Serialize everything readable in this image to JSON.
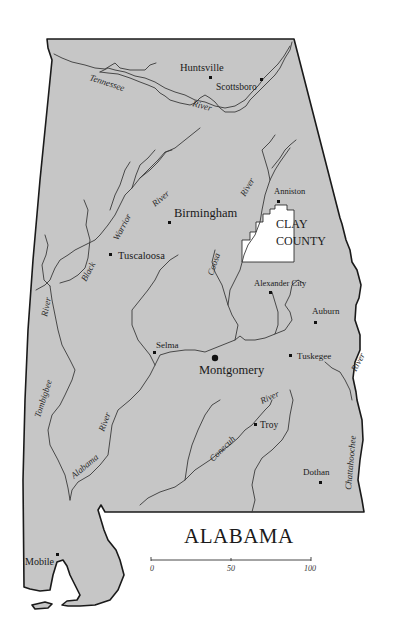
{
  "map": {
    "title": "ALABAMA",
    "colors": {
      "land": "#c6c6c6",
      "highlight_county": "#ffffff",
      "border": "#1a1a1a",
      "background": "#ffffff"
    },
    "highlight": {
      "label_line1": "CLAY",
      "label_line2": "COUNTY"
    },
    "cities": [
      {
        "name": "Huntsville",
        "size": "medium"
      },
      {
        "name": "Scottsboro",
        "size": "small"
      },
      {
        "name": "Birmingham",
        "size": "large"
      },
      {
        "name": "Anniston",
        "size": "small"
      },
      {
        "name": "Tuscaloosa",
        "size": "medium"
      },
      {
        "name": "Alexander City",
        "size": "small"
      },
      {
        "name": "Auburn",
        "size": "small"
      },
      {
        "name": "Selma",
        "size": "small"
      },
      {
        "name": "Montgomery",
        "size": "large"
      },
      {
        "name": "Tuskegee",
        "size": "small"
      },
      {
        "name": "Troy",
        "size": "medium"
      },
      {
        "name": "Dothan",
        "size": "small"
      },
      {
        "name": "Mobile",
        "size": "medium"
      }
    ],
    "rivers": {
      "tennessee": "Tennessee",
      "tennessee_river": "River",
      "black": "Black",
      "warrior": "Warrior",
      "warrior_river": "River",
      "coosa": "Coosa",
      "coosa_river": "River",
      "tombigbee_river": "River",
      "tombigbee": "Tombigbee",
      "alabama": "Alabama",
      "alabama_river": "River",
      "conecuh": "Conecuh",
      "conecuh_river": "River",
      "chattahoochee": "Chattahoochee",
      "chattahoochee_river": "River"
    },
    "scale": {
      "ticks": [
        "0",
        "50",
        "100"
      ]
    }
  }
}
